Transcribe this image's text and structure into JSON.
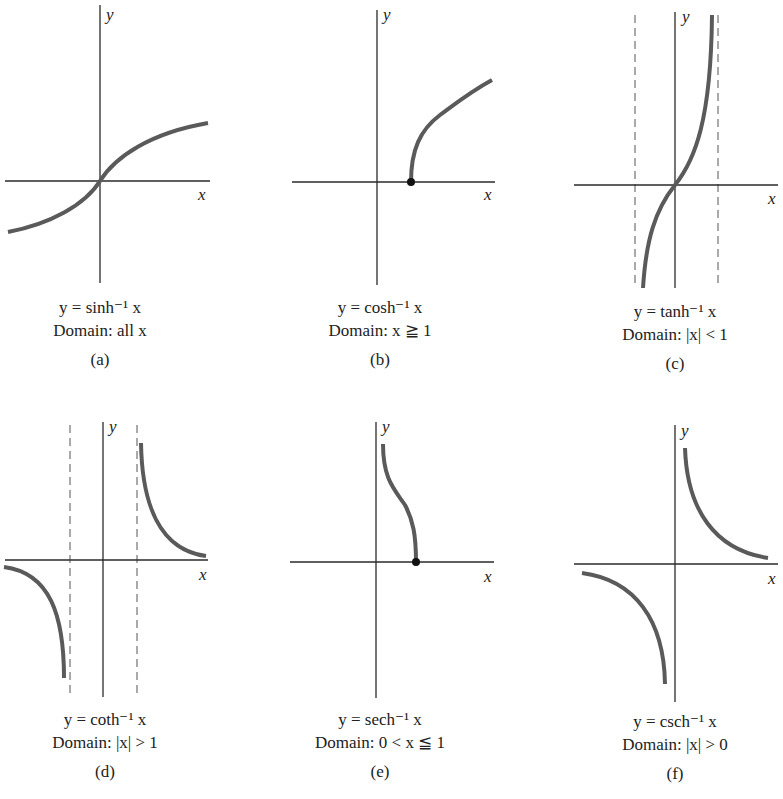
{
  "figure": {
    "panels": [
      {
        "id": "a",
        "equation": "y = sinh⁻¹ x",
        "domain": "Domain: all x",
        "tag": "(a)"
      },
      {
        "id": "b",
        "equation": "y = cosh⁻¹ x",
        "domain": "Domain: x ≧ 1",
        "tag": "(b)"
      },
      {
        "id": "c",
        "equation": "y = tanh⁻¹ x",
        "domain": "Domain: |x| < 1",
        "tag": "(c)"
      },
      {
        "id": "d",
        "equation": "y = coth⁻¹ x",
        "domain": "Domain: |x| > 1",
        "tag": "(d)"
      },
      {
        "id": "e",
        "equation": "y = sech⁻¹ x",
        "domain": "Domain: 0 < x ≦ 1",
        "tag": "(e)"
      },
      {
        "id": "f",
        "equation": "y = csch⁻¹ x",
        "domain": "Domain: |x| > 0",
        "tag": "(f)"
      }
    ],
    "axis_labels": {
      "x": "x",
      "y": "y"
    },
    "colors": {
      "curve": "#5a5a5a",
      "axis": "#2a2a2a",
      "asymptote": "#555555",
      "point": "#111111"
    }
  }
}
